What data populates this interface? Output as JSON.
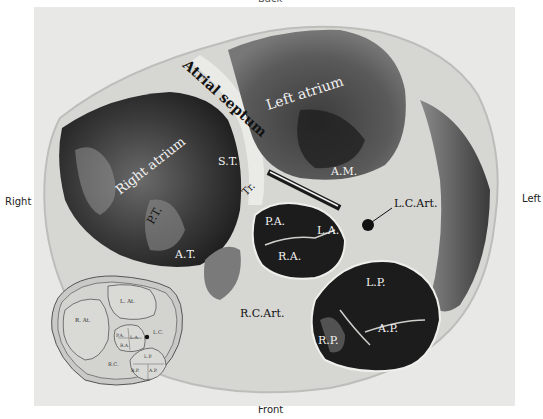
{
  "figure": {
    "orientation": {
      "top": "Back",
      "left": "Right",
      "right": "Left",
      "bottom": "Front"
    },
    "photo_labels": {
      "atrial_septum": "Atrial septum",
      "left_atrium": "Left atrium",
      "right_atrium": "Right atrium",
      "st": "S.T.",
      "am": "A.M.",
      "pt": "P.T.",
      "at": "A.T.",
      "tr": "Tr.",
      "lc_art": "L.C.Art.",
      "pa": "P.A.",
      "la": "L.A.",
      "ra": "R.A.",
      "rc_art": "R.C.Art.",
      "lp": "L.P.",
      "rp": "R.P.",
      "ap": "A.P."
    },
    "inset_labels": {
      "l_at": "L. At.",
      "r_at": "R. At.",
      "pa": "P.A.",
      "la": "L.A.",
      "ra": "R.A.",
      "lc": "L.C.",
      "rc": "R.C.",
      "lp": "L.P.",
      "rp": "R.P.",
      "ap": "A.P."
    },
    "colors": {
      "background": "#e8e8e6",
      "tissue_light": "#d9d9d6",
      "tissue_dark": "#2b2b2b",
      "chamber": "#1a1a1a",
      "label_light": "#f2f2f2",
      "label_dark": "#111111"
    }
  }
}
